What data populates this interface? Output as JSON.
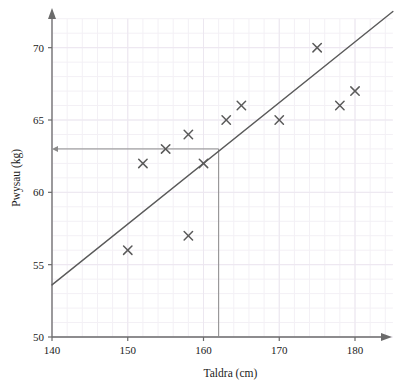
{
  "chart_data": {
    "type": "scatter",
    "title": "",
    "xlabel": "Taldra (cm)",
    "ylabel": "Pwysau (kg)",
    "xlim": [
      140,
      185
    ],
    "ylim": [
      50,
      72
    ],
    "xticks": [
      140,
      150,
      160,
      170,
      180
    ],
    "xtick_labels": [
      "140",
      "150",
      "160",
      "170",
      "180"
    ],
    "yticks": [
      50,
      55,
      60,
      65,
      70
    ],
    "ytick_labels": [
      "50",
      "55",
      "60",
      "65",
      "70"
    ],
    "grid": true,
    "grid_minor_step_x": 2,
    "grid_minor_step_y": 1,
    "legend": "none",
    "points": [
      {
        "x": 150,
        "y": 56
      },
      {
        "x": 152,
        "y": 62
      },
      {
        "x": 155,
        "y": 63
      },
      {
        "x": 158,
        "y": 57
      },
      {
        "x": 158,
        "y": 64
      },
      {
        "x": 160,
        "y": 62
      },
      {
        "x": 163,
        "y": 65
      },
      {
        "x": 165,
        "y": 66
      },
      {
        "x": 170,
        "y": 65
      },
      {
        "x": 175,
        "y": 70
      },
      {
        "x": 178,
        "y": 66
      },
      {
        "x": 180,
        "y": 67
      }
    ],
    "line_of_best_fit": {
      "name": "line of best fit",
      "x_start": 140,
      "y_start": 53.6,
      "x_end": 185,
      "y_end": 72.5
    },
    "construction_lines": {
      "vertical": {
        "x": 162,
        "y_from": 50,
        "y_to": 63
      },
      "horizontal": {
        "y": 63,
        "x_from": 162,
        "x_to": 140,
        "arrow": "left"
      }
    },
    "reading": {
      "x": 162,
      "y": 63
    }
  },
  "colors": {
    "axis": "#6b6b6b",
    "grid_minor": "#f3f0f5",
    "grid_major": "#ece7f0",
    "marker": "#5a5a5a",
    "fit_line": "#5a5a5a",
    "construction": "#8a8a8a",
    "text": "#1a1a1a",
    "background": "#ffffff"
  }
}
